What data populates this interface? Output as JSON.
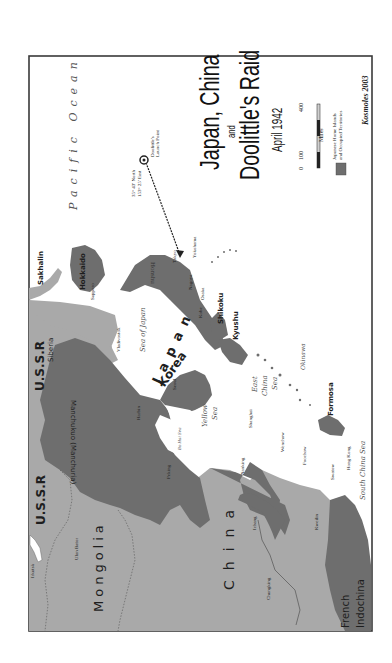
{
  "map": {
    "title_line1": "Japan, China",
    "title_line2": "and",
    "title_line3": "Doolittle's Raid",
    "date": "April 1942",
    "credit": "Kosmoles 2003",
    "orientation": "rotated 90 degrees counter-clockwise",
    "colors": {
      "border": "#3a3a3a",
      "water": "#ffffff",
      "japanese_territory": "#6e6e6e",
      "other_land": "#a9a9a9",
      "text": "#1e1e1e"
    },
    "scale": {
      "ticks": [
        "0",
        "100",
        "400"
      ],
      "unit": "Miles"
    },
    "legend": {
      "swatch_color": "#6e6e6e",
      "label_line1": "Japanese Home Islands",
      "label_line2": "and Occupied Territories"
    },
    "launch_point": {
      "coord_line1": "35° 43' North",
      "coord_line2": "153° 25' East",
      "label_line1": "Doolittle's",
      "label_line2": "Launch Point"
    },
    "oceans": {
      "pacific": "Pacific Ocean",
      "sea_of_japan": "Sea of Japan",
      "yellow_sea_1": "Yellow",
      "yellow_sea_2": "Sea",
      "east_china_1": "East",
      "east_china_2": "China",
      "east_china_3": "Sea",
      "south_china": "South China Sea",
      "bo_hai": "Bo Hai Sea"
    },
    "regions": {
      "japan": "Japan",
      "korea": "Korea",
      "china": "China",
      "mongolia": "Mongolia",
      "ussr_1": "U.S.S.R",
      "ussr_2": "U.S.S.R",
      "siberia": "Siberia",
      "sakhalin": "Sakhalin",
      "hokkaido": "Hokkaido",
      "honshu": "Honshu",
      "shikoku": "Shikoku",
      "kyushu": "Kyushu",
      "okinawa": "Okinawa",
      "formosa": "Formosa",
      "french_indochina_1": "French",
      "french_indochina_2": "Indochina",
      "manchukuo": "Manchukuo (Manchuria)"
    },
    "cities": {
      "tokyo": "Tokyo",
      "yokohama": "Yokohama",
      "nagoya": "Nagoya",
      "osaka": "Osaka",
      "kobe": "Kobe",
      "sapporo": "Sapporo",
      "vladivostok": "Vladivostok",
      "harbin": "Harbin",
      "peking": "Peking",
      "seoul": "Seoul",
      "shanghai": "Shanghai",
      "nanking": "Nanking",
      "wenchow": "Wenchow",
      "foochow": "Foochow",
      "swatow": "Swatow",
      "hong_kong": "Hong Kong",
      "kweilin": "Kweilin",
      "ichang": "Ichang",
      "chungking": "Chungking",
      "ulan_bator": "Ulan Bator",
      "irkutsk": "Irkutsk"
    }
  }
}
